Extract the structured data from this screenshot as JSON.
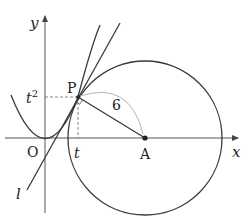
{
  "diagram": {
    "labels": {
      "y_axis": "y",
      "x_axis": "x",
      "origin": "O",
      "point_p": "P",
      "point_a": "A",
      "t_tick": "t",
      "t_squared_base": "t",
      "t_squared_exp": "2",
      "line_l": "l",
      "segment_length": "6"
    },
    "colors": {
      "stroke": "#3a3a3a",
      "axis": "#555555",
      "arc": "#aaaaaa",
      "dashed": "#666666"
    }
  }
}
